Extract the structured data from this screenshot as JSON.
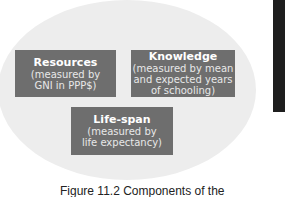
{
  "figure": {
    "components": [
      {
        "title": "Resources",
        "lines": [
          "(measured by",
          "GNI in PPP$)"
        ]
      },
      {
        "title": "Knowledge",
        "lines": [
          "(measured by mean",
          "and expected years",
          "of schooling)"
        ]
      },
      {
        "title": "Life-span",
        "lines": [
          "(measured by",
          "life expectancy)"
        ]
      }
    ],
    "caption": "Figure 11.2 Components of the"
  },
  "colors": {
    "ellipse": "#ededed",
    "box": "#6e6e6e",
    "text": "#ffffff",
    "side_bar": "#1e1e1e"
  }
}
